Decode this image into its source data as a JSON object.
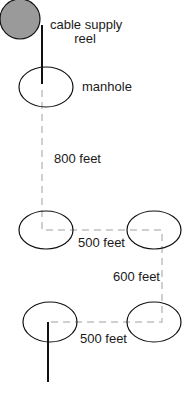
{
  "diagram": {
    "reel_label_line1": "cable supply",
    "reel_label_line2": "reel",
    "manhole_label": "manhole",
    "segments": [
      {
        "label": "800 feet"
      },
      {
        "label": "500 feet"
      },
      {
        "label": "600 feet"
      },
      {
        "label": "500 feet"
      }
    ],
    "colors": {
      "reel_fill": "#9a9a9a",
      "outline": "#111111",
      "duct_path": "#cfcfcf"
    }
  }
}
